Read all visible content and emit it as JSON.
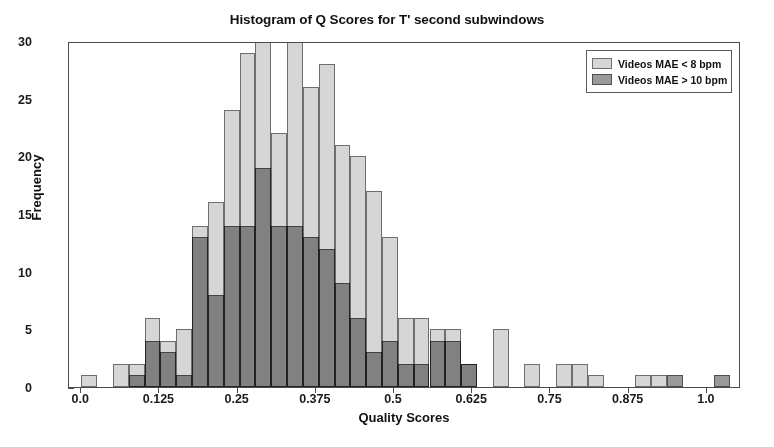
{
  "chart_data": {
    "type": "bar",
    "title": "Histogram of Q Scores for T' second subwindows",
    "xlabel": "Quality Scores",
    "ylabel": "Frequency",
    "xlim": [
      -0.0195,
      1.0545
    ],
    "ylim": [
      0,
      30
    ],
    "grid": false,
    "legend_position": "upper right",
    "xticks": [
      "0.0",
      "0.125",
      "0.25",
      "0.375",
      "0.5",
      "0.625",
      "0.75",
      "0.875",
      "1.0"
    ],
    "xtick_values": [
      0.0,
      0.125,
      0.25,
      0.375,
      0.5,
      0.625,
      0.75,
      0.875,
      1.0
    ],
    "yticks": [
      "0",
      "5",
      "10",
      "15",
      "20",
      "25",
      "30"
    ],
    "ytick_values": [
      0,
      5,
      10,
      15,
      20,
      25,
      30
    ],
    "bin_width": 0.0253,
    "bin_centers": [
      0.0127,
      0.038,
      0.0633,
      0.0886,
      0.1139,
      0.1392,
      0.1645,
      0.1898,
      0.2151,
      0.2404,
      0.2657,
      0.291,
      0.3163,
      0.3416,
      0.3669,
      0.3922,
      0.4175,
      0.4428,
      0.4681,
      0.4934,
      0.5187,
      0.544,
      0.5693,
      0.5946,
      0.6199,
      0.6452,
      0.6705,
      0.6958,
      0.7211,
      0.7464,
      0.7717,
      0.797,
      0.8223,
      0.8476,
      0.8729,
      0.8982,
      0.9235,
      0.9488,
      0.9741,
      0.9994,
      1.0247
    ],
    "series": [
      {
        "name": "Videos MAE < 8 bpm",
        "color": "#d6d6d6",
        "values": [
          1,
          0,
          2,
          2,
          6,
          4,
          5,
          14,
          16,
          24,
          29,
          30,
          22,
          30,
          26,
          28,
          21,
          20,
          17,
          13,
          6,
          6,
          5,
          5,
          2,
          0,
          5,
          0,
          2,
          0,
          2,
          2,
          1,
          0,
          0,
          1,
          1,
          0,
          0,
          0,
          0
        ]
      },
      {
        "name": "Videos MAE > 10 bpm",
        "color": "#9a9a9a",
        "values": [
          0,
          0,
          0,
          1,
          4,
          3,
          1,
          13,
          8,
          14,
          14,
          19,
          14,
          14,
          13,
          12,
          9,
          6,
          3,
          4,
          2,
          2,
          4,
          4,
          2,
          0,
          0,
          0,
          0,
          0,
          0,
          0,
          0,
          0,
          0,
          0,
          0,
          1,
          0,
          0,
          1
        ]
      }
    ]
  },
  "legend": {
    "entries": [
      {
        "label": "Videos MAE < 8 bpm"
      },
      {
        "label": "Videos MAE > 10 bpm"
      }
    ]
  }
}
